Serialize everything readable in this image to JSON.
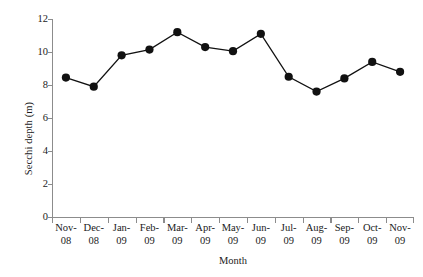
{
  "chart_data": {
    "type": "line",
    "title": "",
    "xlabel": "Month",
    "ylabel": "Secchi depth (m)",
    "categories": [
      "Nov-08",
      "Dec-08",
      "Jan-09",
      "Feb-09",
      "Mar-09",
      "Apr-09",
      "May-09",
      "Jun-09",
      "Jul-09",
      "Aug-09",
      "Sep-09",
      "Oct-09",
      "Nov-09"
    ],
    "category_lines": [
      [
        "Nov-",
        "08"
      ],
      [
        "Dec-",
        "08"
      ],
      [
        "Jan-",
        "09"
      ],
      [
        "Feb-",
        "09"
      ],
      [
        "Mar-",
        "09"
      ],
      [
        "Apr-",
        "09"
      ],
      [
        "May-",
        "09"
      ],
      [
        "Jun-",
        "09"
      ],
      [
        "Jul-",
        "09"
      ],
      [
        "Aug-",
        "09"
      ],
      [
        "Sep-",
        "09"
      ],
      [
        "Oct-",
        "09"
      ],
      [
        "Nov-",
        "09"
      ]
    ],
    "values": [
      8.45,
      7.9,
      9.8,
      10.15,
      11.2,
      10.3,
      10.05,
      11.1,
      8.5,
      7.6,
      8.4,
      9.4,
      8.8
    ],
    "ylim": [
      0,
      12
    ],
    "yticks": [
      0,
      2,
      4,
      6,
      8,
      10,
      12
    ],
    "ytick_labels": [
      "0",
      "2",
      "4",
      "6",
      "8",
      "10",
      "12"
    ],
    "grid": false,
    "legend": false,
    "marker": "filled-circle",
    "marker_color": "#111111",
    "line_color": "#111111",
    "axis_color": "#8c8c8c",
    "background_color": "#ffffff"
  }
}
